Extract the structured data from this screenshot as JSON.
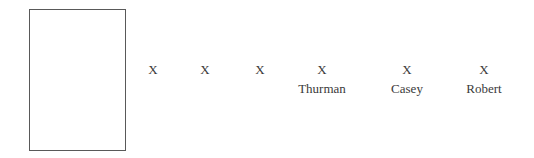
{
  "diagram": {
    "background_color": "#ffffff",
    "text_color": "#3a3a3a",
    "border_color": "#595959",
    "frame_box": {
      "name": "empty-rectangle",
      "content": "",
      "x": 29,
      "y": 9,
      "width": 97,
      "height": 142
    },
    "markers": [
      {
        "symbol": "X",
        "label": "",
        "center_x": 153,
        "x_baseline_y": 73
      },
      {
        "symbol": "X",
        "label": "",
        "center_x": 205,
        "x_baseline_y": 73
      },
      {
        "symbol": "X",
        "label": "",
        "center_x": 260,
        "x_baseline_y": 73
      },
      {
        "symbol": "X",
        "label": "Thurman",
        "center_x": 322,
        "x_baseline_y": 73
      },
      {
        "symbol": "X",
        "label": "Casey",
        "center_x": 407,
        "x_baseline_y": 73
      },
      {
        "symbol": "X",
        "label": "Robert",
        "center_x": 484,
        "x_baseline_y": 73
      }
    ]
  }
}
